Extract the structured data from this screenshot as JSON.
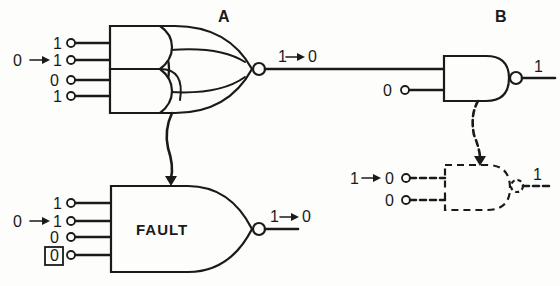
{
  "diagram": {
    "colors": {
      "ink": "#1a1a1a",
      "paper": "#fdfdfb"
    },
    "gate_a": {
      "label": "A",
      "type": "AND-OR-INVERT",
      "inputs": [
        {
          "value": "1",
          "change_from": ""
        },
        {
          "value": "1",
          "change_from": "0"
        },
        {
          "value": "0",
          "change_from": ""
        },
        {
          "value": "1",
          "change_from": ""
        }
      ],
      "output_from": "1",
      "output_to": "0"
    },
    "gate_b": {
      "label": "B",
      "type": "NAND",
      "input_from_a": "",
      "input_2": "0",
      "output": "1"
    },
    "fault_gate": {
      "label": "FAULT",
      "type": "NOR-shaped fault equivalent",
      "inputs": [
        {
          "value": "1",
          "change_from": "",
          "boxed": false
        },
        {
          "value": "1",
          "change_from": "0",
          "boxed": false
        },
        {
          "value": "0",
          "change_from": "",
          "boxed": false
        },
        {
          "value": "0",
          "change_from": "",
          "boxed": true
        }
      ],
      "output_from": "1",
      "output_to": "0"
    },
    "equivalent_b": {
      "style": "dashed",
      "type": "NAND",
      "inputs": [
        {
          "value": "0",
          "change_from": "1"
        },
        {
          "value": "0",
          "change_from": ""
        }
      ],
      "output": "1"
    },
    "arrow_glyph": "→"
  }
}
